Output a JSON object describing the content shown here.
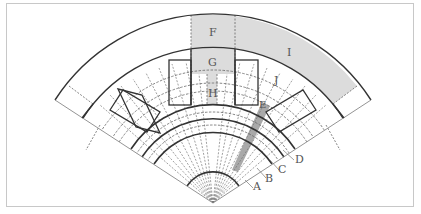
{
  "diagram": {
    "labels": {
      "A": "A",
      "B": "B",
      "C": "C",
      "D": "D",
      "E": "E",
      "F": "F",
      "G": "G",
      "H": "H",
      "I": "I",
      "J": "J"
    },
    "colors": {
      "line": "#333333",
      "dashed": "#666666",
      "shade_light": "#dcdcdc",
      "shade_dark": "#9a9a9a",
      "frame": "#c8c8c8",
      "label": "#555555"
    }
  }
}
